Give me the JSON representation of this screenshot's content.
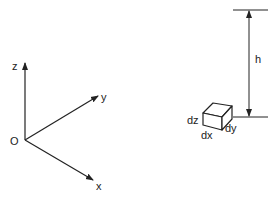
{
  "diagram": {
    "colors": {
      "line": "#222222",
      "background": "#ffffff"
    },
    "axes": {
      "origin_label": "O",
      "z_label": "z",
      "y_label": "y",
      "x_label": "x"
    },
    "element": {
      "height_label": "h",
      "dz_label": "dz",
      "dx_label": "dx",
      "dy_label": "dy"
    }
  }
}
